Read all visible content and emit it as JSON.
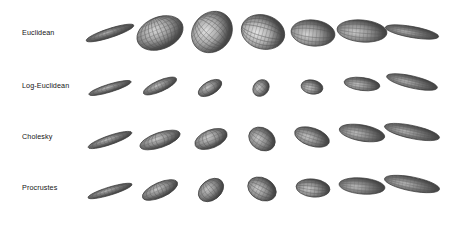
{
  "figure": {
    "type": "ellipsoid-grid",
    "background": "#ffffff",
    "width": 452,
    "height": 226,
    "rows": 4,
    "columns": 7,
    "colors": {
      "ink": "#141414",
      "mesh_dark": "#4a4a4a",
      "mesh_mid": "#8f8f8f",
      "mesh_light": "#d2d2d2",
      "highlight": "#f2f2f2",
      "outline": "#3c3c3c"
    },
    "column_centers_x": [
      110,
      160,
      212,
      263,
      313,
      362,
      412
    ],
    "row_centers_y": [
      33,
      86,
      137,
      188
    ],
    "row_labels": [
      {
        "label": "Euclidean",
        "x": 22,
        "y": 33
      },
      {
        "label": "Log-Euclidean",
        "x": 22,
        "y": 86
      },
      {
        "label": "Cholesky",
        "x": 22,
        "y": 137
      },
      {
        "label": "Procrustes",
        "x": 22,
        "y": 188
      }
    ],
    "ellipsoids": [
      {
        "row": 0,
        "col": 0,
        "cx": 110,
        "cy": 33,
        "rx": 25,
        "ry": 4.5,
        "angle": -18,
        "shade": 0.3,
        "mesh": 0.35
      },
      {
        "row": 0,
        "col": 1,
        "cx": 160,
        "cy": 33,
        "rx": 24,
        "ry": 16,
        "angle": -22,
        "shade": 0.72,
        "mesh": 0.95
      },
      {
        "row": 0,
        "col": 2,
        "cx": 212,
        "cy": 32,
        "rx": 22,
        "ry": 19,
        "angle": -48,
        "shade": 0.82,
        "mesh": 1.0
      },
      {
        "row": 0,
        "col": 3,
        "cx": 263,
        "cy": 32,
        "rx": 17,
        "ry": 22,
        "angle": -74,
        "shade": 0.88,
        "mesh": 1.0
      },
      {
        "row": 0,
        "col": 4,
        "cx": 313,
        "cy": 33,
        "rx": 13,
        "ry": 22,
        "angle": -84,
        "shade": 0.7,
        "mesh": 0.85
      },
      {
        "row": 0,
        "col": 5,
        "cx": 362,
        "cy": 31,
        "rx": 11,
        "ry": 25,
        "angle": -85,
        "shade": 0.62,
        "mesh": 0.7
      },
      {
        "row": 0,
        "col": 6,
        "cx": 412,
        "cy": 32,
        "rx": 5.5,
        "ry": 27,
        "angle": -80,
        "shade": 0.38,
        "mesh": 0.4
      },
      {
        "row": 1,
        "col": 0,
        "cx": 110,
        "cy": 88,
        "rx": 22,
        "ry": 4.0,
        "angle": -17,
        "shade": 0.4,
        "mesh": 0.4
      },
      {
        "row": 1,
        "col": 1,
        "cx": 160,
        "cy": 86,
        "rx": 18,
        "ry": 5.5,
        "angle": -24,
        "shade": 0.48,
        "mesh": 0.45
      },
      {
        "row": 1,
        "col": 2,
        "cx": 210,
        "cy": 88,
        "rx": 13,
        "ry": 6.5,
        "angle": -30,
        "shade": 0.52,
        "mesh": 0.5
      },
      {
        "row": 1,
        "col": 3,
        "cx": 261,
        "cy": 88,
        "rx": 9,
        "ry": 7.5,
        "angle": -48,
        "shade": 0.6,
        "mesh": 0.6
      },
      {
        "row": 1,
        "col": 4,
        "cx": 312,
        "cy": 87,
        "rx": 7,
        "ry": 11,
        "angle": -80,
        "shade": 0.6,
        "mesh": 0.6
      },
      {
        "row": 1,
        "col": 5,
        "cx": 362,
        "cy": 84,
        "rx": 6.5,
        "ry": 18,
        "angle": -83,
        "shade": 0.55,
        "mesh": 0.5
      },
      {
        "row": 1,
        "col": 6,
        "cx": 412,
        "cy": 82,
        "rx": 6,
        "ry": 26,
        "angle": -77,
        "shade": 0.42,
        "mesh": 0.45
      },
      {
        "row": 2,
        "col": 0,
        "cx": 110,
        "cy": 140,
        "rx": 23,
        "ry": 4.5,
        "angle": -19,
        "shade": 0.42,
        "mesh": 0.45
      },
      {
        "row": 2,
        "col": 1,
        "cx": 160,
        "cy": 140,
        "rx": 21,
        "ry": 7.5,
        "angle": -19,
        "shade": 0.58,
        "mesh": 0.7
      },
      {
        "row": 2,
        "col": 2,
        "cx": 211,
        "cy": 139,
        "rx": 17,
        "ry": 9,
        "angle": -22,
        "shade": 0.62,
        "mesh": 0.75
      },
      {
        "row": 2,
        "col": 3,
        "cx": 262,
        "cy": 139,
        "rx": 11,
        "ry": 14,
        "angle": -58,
        "shade": 0.6,
        "mesh": 0.6
      },
      {
        "row": 2,
        "col": 4,
        "cx": 312,
        "cy": 137,
        "rx": 9,
        "ry": 18,
        "angle": -72,
        "shade": 0.58,
        "mesh": 0.55
      },
      {
        "row": 2,
        "col": 5,
        "cx": 362,
        "cy": 133,
        "rx": 8,
        "ry": 23,
        "angle": -80,
        "shade": 0.5,
        "mesh": 0.45
      },
      {
        "row": 2,
        "col": 6,
        "cx": 412,
        "cy": 132,
        "rx": 6.5,
        "ry": 28,
        "angle": -78,
        "shade": 0.42,
        "mesh": 0.45
      },
      {
        "row": 3,
        "col": 0,
        "cx": 110,
        "cy": 191,
        "rx": 23,
        "ry": 4.0,
        "angle": -17,
        "shade": 0.38,
        "mesh": 0.4
      },
      {
        "row": 3,
        "col": 1,
        "cx": 160,
        "cy": 190,
        "rx": 19,
        "ry": 7.5,
        "angle": -24,
        "shade": 0.55,
        "mesh": 0.7
      },
      {
        "row": 3,
        "col": 2,
        "cx": 211,
        "cy": 190,
        "rx": 14,
        "ry": 10,
        "angle": -38,
        "shade": 0.58,
        "mesh": 0.6
      },
      {
        "row": 3,
        "col": 3,
        "cx": 262,
        "cy": 189,
        "rx": 11,
        "ry": 15,
        "angle": -62,
        "shade": 0.62,
        "mesh": 0.8
      },
      {
        "row": 3,
        "col": 4,
        "cx": 313,
        "cy": 188,
        "rx": 9,
        "ry": 17,
        "angle": -84,
        "shade": 0.62,
        "mesh": 0.8
      },
      {
        "row": 3,
        "col": 5,
        "cx": 362,
        "cy": 186,
        "rx": 8,
        "ry": 23,
        "angle": -85,
        "shade": 0.48,
        "mesh": 0.4
      },
      {
        "row": 3,
        "col": 6,
        "cx": 412,
        "cy": 184,
        "rx": 7,
        "ry": 28,
        "angle": -79,
        "shade": 0.45,
        "mesh": 0.45
      }
    ]
  }
}
